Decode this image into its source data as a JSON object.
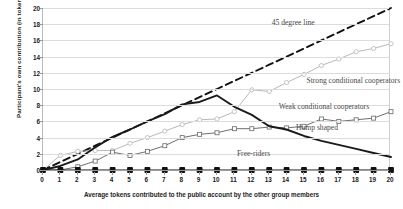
{
  "chart_data": {
    "type": "line",
    "title": "",
    "xlabel": "Average tokens contributed to the public account by the other group members",
    "ylabel": "Participant's own contribution (in tokens)",
    "xlim": [
      0,
      20
    ],
    "ylim": [
      0,
      20
    ],
    "xticks": [
      0,
      1,
      2,
      3,
      4,
      5,
      6,
      7,
      8,
      9,
      10,
      11,
      12,
      13,
      14,
      15,
      16,
      17,
      18,
      19,
      20
    ],
    "yticks": [
      0,
      2,
      4,
      6,
      8,
      10,
      12,
      14,
      16,
      18,
      20
    ],
    "grid": true,
    "legend_position": "inline-annotations",
    "x": [
      0,
      1,
      2,
      3,
      4,
      5,
      6,
      7,
      8,
      9,
      10,
      11,
      12,
      13,
      14,
      15,
      16,
      17,
      18,
      19,
      20
    ],
    "series": [
      {
        "name": "45 degree line",
        "style": "dashed",
        "color": "#111111",
        "marker": "none",
        "values": [
          0,
          1,
          2,
          3,
          4,
          5,
          6,
          7,
          8,
          9,
          10,
          11,
          12,
          13,
          14,
          15,
          16,
          17,
          18,
          19,
          20
        ]
      },
      {
        "name": "Strong conditional cooperators",
        "style": "solid",
        "color": "#b9b9b9",
        "marker": "open-circle",
        "values": [
          0,
          1.8,
          2.3,
          2.4,
          2.4,
          3.3,
          4.0,
          4.8,
          5.6,
          6.2,
          6.3,
          7.2,
          9.9,
          9.7,
          10.8,
          11.8,
          12.9,
          13.7,
          14.6,
          15.0,
          15.6
        ]
      },
      {
        "name": "Weak conditional cooperators",
        "style": "solid",
        "color": "#6f6f6f",
        "marker": "open-square",
        "values": [
          0,
          0,
          0.4,
          1.1,
          2.2,
          1.8,
          2.3,
          3.0,
          4.0,
          4.4,
          4.6,
          5.1,
          5.1,
          5.3,
          5.2,
          5.4,
          6.3,
          6.0,
          6.2,
          6.4,
          7.2
        ]
      },
      {
        "name": "Hump shaped",
        "style": "solid-thick",
        "color": "#1a1a1a",
        "marker": "none",
        "values": [
          0,
          0.5,
          1.3,
          2.8,
          4.1,
          5.0,
          6.0,
          6.9,
          8.1,
          8.4,
          9.2,
          7.8,
          6.8,
          5.4,
          5.0,
          4.2,
          3.6,
          3.1,
          2.6,
          2.1,
          1.6
        ]
      },
      {
        "name": "Free-riders",
        "style": "solid",
        "color": "#111111",
        "marker": "filled-square",
        "values": [
          0,
          0,
          0,
          0,
          0,
          0,
          0,
          0,
          0,
          0,
          0,
          0,
          0,
          0,
          0,
          0,
          0,
          0,
          0,
          0,
          0
        ]
      }
    ],
    "annotations": [
      {
        "text": "45 degree line",
        "x": 13.2,
        "y": 18.2
      },
      {
        "text": "Strong conditional cooperators",
        "x": 15.2,
        "y": 11.0
      },
      {
        "text": "Weak conditional cooperators",
        "x": 13.6,
        "y": 7.8
      },
      {
        "text": "Hump shaped",
        "x": 14.6,
        "y": 5.2
      },
      {
        "text": "Free-riders",
        "x": 11.2,
        "y": 2.0
      }
    ]
  }
}
